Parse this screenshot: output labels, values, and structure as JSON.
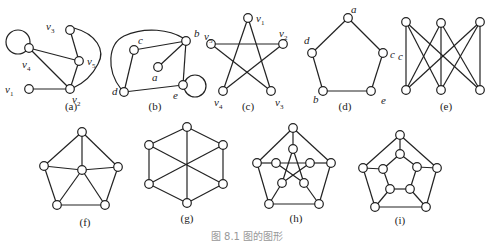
{
  "caption": "图 8.1  图的图形",
  "graphs": [
    {
      "id": "a",
      "label": "(a)",
      "label_pos": [
        71,
        110
      ],
      "nodes": [
        {
          "id": "v3",
          "x": 70,
          "y": 30,
          "name": "v",
          "sub": "3",
          "lx": 46,
          "ly": 30
        },
        {
          "id": "v4",
          "x": 29,
          "y": 48,
          "name": "v",
          "sub": "4",
          "lx": 22,
          "ly": 68
        },
        {
          "id": "v5",
          "x": 79,
          "y": 61,
          "name": "v",
          "sub": "5",
          "lx": 87,
          "ly": 65
        },
        {
          "id": "v1",
          "x": 29,
          "y": 89,
          "name": "v",
          "sub": "1",
          "lx": 5,
          "ly": 93
        },
        {
          "id": "v2",
          "x": 70,
          "y": 89,
          "name": "v",
          "sub": "2",
          "lx": 72,
          "ly": 103
        }
      ],
      "edges": [
        [
          "v3",
          "v5"
        ],
        [
          "v4",
          "v5"
        ],
        [
          "v4",
          "v2"
        ],
        [
          "v5",
          "v2"
        ],
        [
          "v1",
          "v2"
        ]
      ],
      "curves": [
        {
          "d": "M74,28 C96,34 106,50 98,64 C92,76 82,84 73,88"
        }
      ],
      "loops": [
        {
          "node": "v4",
          "cx": 18,
          "cy": 42,
          "r": 12
        }
      ]
    },
    {
      "id": "b",
      "label": "(b)",
      "label_pos": [
        155,
        110
      ],
      "nodes": [
        {
          "id": "c",
          "x": 134,
          "y": 50,
          "name": "c",
          "lx": 138,
          "ly": 44
        },
        {
          "id": "b",
          "x": 186,
          "y": 41,
          "name": "b",
          "lx": 194,
          "ly": 37
        },
        {
          "id": "a",
          "x": 158,
          "y": 67,
          "name": "a",
          "lx": 152,
          "ly": 81
        },
        {
          "id": "d",
          "x": 124,
          "y": 92,
          "name": "d",
          "lx": 112,
          "ly": 95
        },
        {
          "id": "e",
          "x": 183,
          "y": 85,
          "name": "e",
          "lx": 173,
          "ly": 99
        }
      ],
      "edges": [
        [
          "c",
          "b"
        ],
        [
          "a",
          "b"
        ],
        [
          "b",
          "e"
        ],
        [
          "c",
          "d"
        ],
        [
          "d",
          "e"
        ]
      ],
      "curves": [
        {
          "d": "M121,89 C106,70 108,44 124,36 C146,26 170,30 183,38"
        }
      ],
      "loops": [
        {
          "node": "e",
          "cx": 195,
          "cy": 86,
          "r": 11
        }
      ]
    },
    {
      "id": "c",
      "label": "(c)",
      "label_pos": [
        248,
        110
      ],
      "nodes": [
        {
          "id": "v1",
          "x": 248,
          "y": 18,
          "name": "v",
          "sub": "1",
          "lx": 256,
          "ly": 22
        },
        {
          "id": "v5",
          "x": 211,
          "y": 44,
          "name": "v",
          "sub": "5",
          "lx": 204,
          "ly": 40
        },
        {
          "id": "v2",
          "x": 283,
          "y": 44,
          "name": "v",
          "sub": "2",
          "lx": 279,
          "ly": 37
        },
        {
          "id": "v4",
          "x": 223,
          "y": 91,
          "name": "v",
          "sub": "4",
          "lx": 214,
          "ly": 106
        },
        {
          "id": "v3",
          "x": 271,
          "y": 91,
          "name": "v",
          "sub": "3",
          "lx": 275,
          "ly": 106
        }
      ],
      "edges": [
        [
          "v1",
          "v4"
        ],
        [
          "v1",
          "v3"
        ],
        [
          "v5",
          "v2"
        ],
        [
          "v5",
          "v3"
        ],
        [
          "v2",
          "v4"
        ]
      ],
      "curves": [],
      "loops": []
    },
    {
      "id": "d",
      "label": "(d)",
      "label_pos": [
        345,
        110
      ],
      "nodes": [
        {
          "id": "a",
          "x": 348,
          "y": 18,
          "name": "a",
          "lx": 351,
          "ly": 13
        },
        {
          "id": "d",
          "x": 312,
          "y": 53,
          "name": "d",
          "lx": 304,
          "ly": 44
        },
        {
          "id": "c",
          "x": 383,
          "y": 53,
          "name": "c",
          "lx": 390,
          "ly": 58
        },
        {
          "id": "b",
          "x": 323,
          "y": 91,
          "name": "b",
          "lx": 313,
          "ly": 103
        },
        {
          "id": "e",
          "x": 371,
          "y": 91,
          "name": "e",
          "lx": 381,
          "ly": 104
        }
      ],
      "edges": [
        [
          "a",
          "d"
        ],
        [
          "a",
          "c"
        ],
        [
          "d",
          "b"
        ],
        [
          "c",
          "e"
        ],
        [
          "b",
          "e"
        ]
      ],
      "curves": [],
      "loops": []
    },
    {
      "id": "e",
      "label": "(e)",
      "label_pos": [
        446,
        110
      ],
      "nodes": [
        {
          "id": "t1",
          "x": 406,
          "y": 22
        },
        {
          "id": "t2",
          "x": 441,
          "y": 23
        },
        {
          "id": "t3",
          "x": 480,
          "y": 22
        },
        {
          "id": "b1",
          "x": 406,
          "y": 90
        },
        {
          "id": "b2",
          "x": 441,
          "y": 90
        },
        {
          "id": "b3",
          "x": 480,
          "y": 90
        },
        {
          "id": "c_label",
          "x": -100,
          "y": -100,
          "name": "c",
          "lx": 398,
          "ly": 60,
          "hidden": true
        }
      ],
      "edges": [
        [
          "t1",
          "b1"
        ],
        [
          "t1",
          "b2"
        ],
        [
          "t1",
          "b3"
        ],
        [
          "t2",
          "b1"
        ],
        [
          "t2",
          "b2"
        ],
        [
          "t2",
          "b3"
        ],
        [
          "t3",
          "b1"
        ],
        [
          "t3",
          "b2"
        ],
        [
          "t3",
          "b3"
        ]
      ],
      "curves": [],
      "loops": []
    },
    {
      "id": "f",
      "label": "(f)",
      "label_pos": [
        85,
        226
      ],
      "nodes": [
        {
          "id": "top",
          "x": 82,
          "y": 132
        },
        {
          "id": "l",
          "x": 44,
          "y": 166
        },
        {
          "id": "r",
          "x": 118,
          "y": 167
        },
        {
          "id": "c",
          "x": 82,
          "y": 170
        },
        {
          "id": "bl",
          "x": 57,
          "y": 205
        },
        {
          "id": "br",
          "x": 105,
          "y": 205
        }
      ],
      "edges": [
        [
          "top",
          "l"
        ],
        [
          "top",
          "r"
        ],
        [
          "top",
          "c"
        ],
        [
          "l",
          "c"
        ],
        [
          "r",
          "c"
        ],
        [
          "l",
          "bl"
        ],
        [
          "r",
          "br"
        ],
        [
          "bl",
          "br"
        ],
        [
          "c",
          "bl"
        ],
        [
          "c",
          "br"
        ]
      ],
      "curves": [],
      "loops": []
    },
    {
      "id": "g",
      "label": "(g)",
      "label_pos": [
        187,
        222
      ],
      "nodes": [
        {
          "id": "top",
          "x": 187,
          "y": 127
        },
        {
          "id": "ul",
          "x": 149,
          "y": 145
        },
        {
          "id": "ur",
          "x": 223,
          "y": 145
        },
        {
          "id": "ll",
          "x": 149,
          "y": 184
        },
        {
          "id": "lr",
          "x": 223,
          "y": 184
        },
        {
          "id": "bot",
          "x": 187,
          "y": 203
        }
      ],
      "edges": [
        [
          "top",
          "ul"
        ],
        [
          "top",
          "ur"
        ],
        [
          "ul",
          "ll"
        ],
        [
          "ur",
          "lr"
        ],
        [
          "ll",
          "bot"
        ],
        [
          "lr",
          "bot"
        ],
        [
          "top",
          "bot"
        ],
        [
          "ul",
          "lr"
        ],
        [
          "ur",
          "ll"
        ]
      ],
      "curves": [],
      "loops": []
    },
    {
      "id": "h",
      "label": "(h)",
      "label_pos": [
        296,
        222
      ],
      "nodes": [
        {
          "id": "o1",
          "x": 293,
          "y": 128
        },
        {
          "id": "o2",
          "x": 331,
          "y": 163
        },
        {
          "id": "o3",
          "x": 319,
          "y": 204
        },
        {
          "id": "o4",
          "x": 269,
          "y": 204
        },
        {
          "id": "o5",
          "x": 257,
          "y": 163
        },
        {
          "id": "i1",
          "x": 293,
          "y": 149
        },
        {
          "id": "i2",
          "x": 310,
          "y": 163
        },
        {
          "id": "i3",
          "x": 304,
          "y": 183
        },
        {
          "id": "i4",
          "x": 282,
          "y": 183
        },
        {
          "id": "i5",
          "x": 276,
          "y": 163
        }
      ],
      "edges": [
        [
          "o1",
          "o2"
        ],
        [
          "o2",
          "o3"
        ],
        [
          "o3",
          "o4"
        ],
        [
          "o4",
          "o5"
        ],
        [
          "o5",
          "o1"
        ],
        [
          "o1",
          "i1"
        ],
        [
          "o2",
          "i2"
        ],
        [
          "o3",
          "i3"
        ],
        [
          "o4",
          "i4"
        ],
        [
          "o5",
          "i5"
        ],
        [
          "i1",
          "i3"
        ],
        [
          "i3",
          "i5"
        ],
        [
          "i5",
          "i2"
        ],
        [
          "i2",
          "i4"
        ],
        [
          "i4",
          "i1"
        ]
      ],
      "curves": [],
      "loops": []
    },
    {
      "id": "i",
      "label": "(i)",
      "label_pos": [
        400,
        224
      ],
      "nodes": [
        {
          "id": "o1",
          "x": 400,
          "y": 135
        },
        {
          "id": "o2",
          "x": 437,
          "y": 168
        },
        {
          "id": "o3",
          "x": 426,
          "y": 207
        },
        {
          "id": "o4",
          "x": 375,
          "y": 207
        },
        {
          "id": "o5",
          "x": 363,
          "y": 168
        },
        {
          "id": "i1",
          "x": 400,
          "y": 154
        },
        {
          "id": "i2",
          "x": 417,
          "y": 167
        },
        {
          "id": "i3",
          "x": 410,
          "y": 189
        },
        {
          "id": "i4",
          "x": 390,
          "y": 189
        },
        {
          "id": "i5",
          "x": 383,
          "y": 169
        }
      ],
      "edges": [
        [
          "o1",
          "o2"
        ],
        [
          "o2",
          "o3"
        ],
        [
          "o3",
          "o4"
        ],
        [
          "o4",
          "o5"
        ],
        [
          "o5",
          "o1"
        ],
        [
          "o1",
          "i1"
        ],
        [
          "o2",
          "i2"
        ],
        [
          "o3",
          "i3"
        ],
        [
          "o4",
          "i4"
        ],
        [
          "o5",
          "i5"
        ],
        [
          "i1",
          "i2"
        ],
        [
          "i2",
          "i3"
        ],
        [
          "i3",
          "i4"
        ],
        [
          "i4",
          "i5"
        ],
        [
          "i5",
          "i1"
        ]
      ],
      "curves": [],
      "loops": []
    }
  ],
  "style": {
    "stroke": "#222222",
    "node_fill": "#ffffff",
    "node_radius": 4.3,
    "caption_color": "#999999"
  }
}
